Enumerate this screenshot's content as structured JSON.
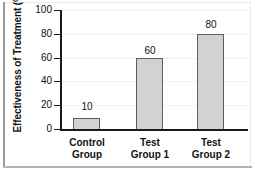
{
  "chart_data": {
    "type": "bar",
    "title": "",
    "xlabel": "",
    "ylabel": "Effectiveness of Treatment (%)",
    "categories": [
      "Control Group",
      "Test Group 1",
      "Test Group 2"
    ],
    "category_lines": [
      [
        "Control",
        "Group"
      ],
      [
        "Test",
        "Group 1"
      ],
      [
        "Test",
        "Group 2"
      ]
    ],
    "values": [
      10,
      60,
      80
    ],
    "value_labels": [
      "10",
      "60",
      "80"
    ],
    "ylim": [
      0,
      100
    ],
    "yticks": [
      0,
      20,
      40,
      60,
      80,
      100
    ],
    "ytick_labels": [
      "0",
      "20",
      "40",
      "60",
      "80",
      "100"
    ],
    "grid": true,
    "legend": "none",
    "bar_fill": "#d2d2d2",
    "bar_stroke": "#5d5d5d",
    "axis_color": "#1a1a1a",
    "grid_color": "#f1f1f1"
  }
}
